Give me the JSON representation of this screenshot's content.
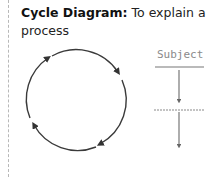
{
  "heading": {
    "title": "Cycle Diagram:",
    "description": "To explain a process"
  },
  "cycle": {
    "arrows": 4,
    "stroke_color": "#3a3a3a"
  },
  "flow": {
    "label": "Subject",
    "label_color": "#8a8a8a",
    "line_color": "#777777"
  }
}
